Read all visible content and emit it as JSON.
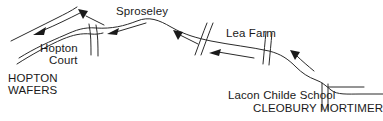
{
  "figure": {
    "kind": "hand-drawn-sketch-map",
    "background_color": "#ffffff",
    "ink_color": "#2a2a2a",
    "width": 383,
    "height": 121
  },
  "labels": {
    "sproseley": "Sproseley",
    "hopton_court_line1": "Hopton",
    "hopton_court_line2": "Court",
    "hopton_wafers_line1": "HOPTON",
    "hopton_wafers_line2": "WAFERS",
    "lea_farm": "Lea Farm",
    "lacon_childe_school": "Lacon Childe School",
    "cleobury_mortimer": "CLEOBURY MORTIMER"
  },
  "roads": {
    "main_route": "M 18,56 C 34,46 50,40 64,34 C 76,29 84,26 96,27 C 112,28 124,25 136,20 C 148,15 158,19 170,26 C 184,34 196,37 210,40 C 230,44 250,46 268,50 C 280,53 288,58 296,66 C 302,72 308,76 316,79 C 322,81 326,85 330,89 C 336,94 346,93 360,93 L 383,93",
    "main_route_inner": "M 20,60 C 36,50 52,44 66,38 C 76,34 84,31 96,32",
    "upper_branch": "M 12,40 C 26,34 44,26 58,20 C 66,16 72,12 78,8",
    "lower_branch": "M 16,63 C 30,54 48,44 62,38 C 72,34 80,32 90,33",
    "hopton_spur": "M 90,27 C 92,36 92,44 92,54",
    "hopton_spur2": "M 96,27 C 98,36 98,45 98,55",
    "cross_road_a1": "M 206,24 C 202,34 198,44 194,54",
    "cross_road_a2": "M 212,24 C 208,34 204,44 200,54",
    "cross_road_b1": "M 266,33 C 265,43 264,53 263,63",
    "cross_road_b2": "M 272,33 C 271,43 270,53 269,63",
    "school_stub1": "M 322,82 C 322,92 322,100 322,108",
    "school_stub2": "M 328,83 C 328,92 328,100 328,108",
    "school_link": "M 328,86 C 338,86 350,86 362,86"
  },
  "arrows": [
    {
      "name": "arrow-hopton-wafers",
      "direction": "down-left",
      "x": 40,
      "y": 32,
      "angle": 215
    },
    {
      "name": "arrow-sproseley-west",
      "direction": "down",
      "x": 83,
      "y": 13,
      "angle": 160
    },
    {
      "name": "arrow-sproseley-east",
      "direction": "left",
      "x": 112,
      "y": 32,
      "angle": 250
    },
    {
      "name": "arrow-mid-route",
      "direction": "down",
      "x": 178,
      "y": 32,
      "angle": 170
    },
    {
      "name": "arrow-lea-farm-west",
      "direction": "left",
      "x": 214,
      "y": 51,
      "angle": 255
    },
    {
      "name": "arrow-cleobury",
      "direction": "down",
      "x": 295,
      "y": 53,
      "angle": 172
    }
  ]
}
